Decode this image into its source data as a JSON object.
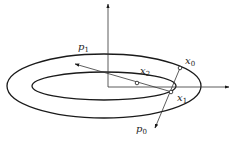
{
  "diagram": {
    "stroke_color": "#1a1a1a",
    "background": "#ffffff",
    "labels": {
      "p1": {
        "base": "p",
        "sub": "1"
      },
      "p0": {
        "base": "p",
        "sub": "0"
      },
      "x0": {
        "base": "x",
        "sub": "0"
      },
      "x1": {
        "base": "x",
        "sub": "1"
      },
      "x2": {
        "base": "x",
        "sub": "2"
      }
    },
    "shapes": {
      "outer_ellipse": {
        "cx": 104,
        "cy": 86,
        "rx": 97,
        "ry": 32
      },
      "inner_ellipse": {
        "cx": 104,
        "cy": 86,
        "rx": 72,
        "ry": 14
      },
      "vertical_axis": {
        "x": 108,
        "y1": 87,
        "y2": 4
      },
      "horizontal_axis": {
        "y": 87,
        "x1": 108,
        "x2": 229
      },
      "ray_p1": {
        "from": [
          172,
          92
        ],
        "to": [
          75,
          64
        ]
      },
      "ray_p0": {
        "from": [
          180,
          68
        ],
        "to": [
          155,
          128
        ]
      },
      "points": [
        {
          "name": "x0",
          "x": 180,
          "y": 68
        },
        {
          "name": "x1",
          "x": 171,
          "y": 92
        },
        {
          "name": "x2",
          "x": 137,
          "y": 83
        }
      ]
    }
  }
}
